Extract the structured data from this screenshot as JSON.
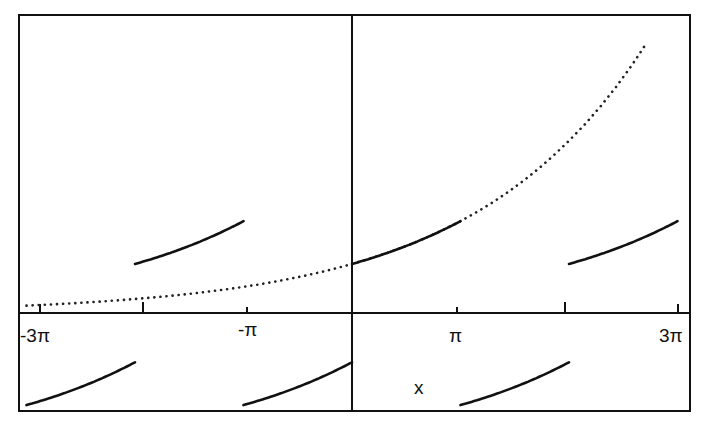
{
  "chart_data": {
    "type": "line",
    "title": "",
    "xlabel": "x",
    "ylabel": "",
    "function_note": "dotted curve approx y = e^(x/5); solid segments are periodic pieces",
    "x_ticks": [
      "-3π",
      "-2π",
      "-π",
      "π",
      "2π",
      "3π"
    ],
    "x_tick_labels_shown": [
      "-3π",
      "-π",
      "π",
      "3π"
    ],
    "xlim": [
      "-3π",
      "3π"
    ],
    "grid": false,
    "legend": null,
    "series": [
      {
        "name": "dotted-curve",
        "style": "dotted",
        "x_range": [
          "-3π",
          "2.72π"
        ],
        "formula": "e^(x/5)"
      },
      {
        "name": "upper-segment-1",
        "style": "solid",
        "x_range": [
          "-2π",
          "-π"
        ]
      },
      {
        "name": "upper-segment-2",
        "style": "solid",
        "x_range": [
          "0",
          "π"
        ]
      },
      {
        "name": "upper-segment-3",
        "style": "solid",
        "x_range": [
          "2π",
          "3π"
        ]
      },
      {
        "name": "lower-segment-1",
        "style": "solid",
        "x_range": [
          "-3π",
          "-2π"
        ]
      },
      {
        "name": "lower-segment-2",
        "style": "solid",
        "x_range": [
          "-π",
          "0"
        ]
      },
      {
        "name": "lower-segment-3",
        "style": "solid",
        "x_range": [
          "π",
          "2π"
        ]
      }
    ]
  },
  "labels": {
    "tick_neg3pi": "-3π",
    "tick_negpi": "-π",
    "tick_pi": "π",
    "tick_3pi": "3π",
    "x_axis": "x"
  }
}
